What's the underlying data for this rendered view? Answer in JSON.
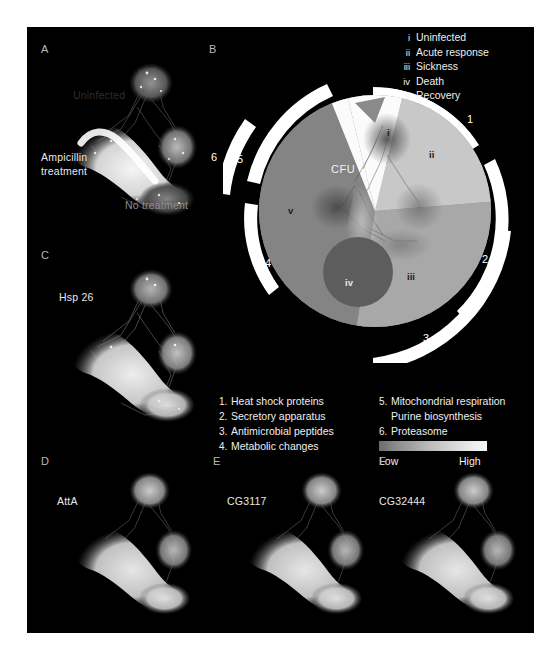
{
  "figure": {
    "background": "#000000",
    "page_background": "#ffffff"
  },
  "panels": [
    {
      "letter": "A",
      "title": "Ampicillin\ntreatment",
      "label_ampicillin": "Ampicillin",
      "label_treatment": "treatment",
      "label_uninfected": "Uninfected",
      "label_no_treatment": "No treatment"
    },
    {
      "letter": "B",
      "title": ""
    },
    {
      "letter": "C",
      "title": "Hsp 26"
    },
    {
      "letter": "D",
      "title": "AttA"
    },
    {
      "letter": "E",
      "title": "CG3117"
    },
    {
      "letter": "F",
      "title": "CG32444"
    }
  ],
  "panel_letters": {
    "a": "A",
    "b": "B",
    "c": "C",
    "d": "D",
    "e": "E",
    "f": "F"
  },
  "stage_legend": {
    "items": [
      {
        "roman": "i",
        "label": "Uninfected"
      },
      {
        "roman": "ii",
        "label": "Acute response"
      },
      {
        "roman": "iii",
        "label": "Sickness"
      },
      {
        "roman": "iv",
        "label": "Death"
      },
      {
        "roman": "v",
        "label": "Recovery"
      }
    ]
  },
  "module_legend": {
    "column_a": [
      {
        "num": "1.",
        "label": "Heat shock proteins"
      },
      {
        "num": "2.",
        "label": "Secretory apparatus"
      },
      {
        "num": "3.",
        "label": "Antimicrobial peptides"
      },
      {
        "num": "4.",
        "label": "Metabolic changes"
      }
    ],
    "column_b": [
      {
        "num": "5.",
        "label": "Mitochondrial respiration"
      },
      {
        "num": "",
        "label": "Purine biosynthesis"
      },
      {
        "num": "6.",
        "label": "Proteasome"
      }
    ]
  },
  "colorbar": {
    "low_label": "Low",
    "high_label": "High",
    "low_color": "#6d6d6d",
    "high_color": "#f6f6f6"
  },
  "diagram": {
    "cfu_label": "CFU",
    "sector_labels": {
      "i": "i",
      "ii": "ii",
      "iii": "iii",
      "iv": "iv",
      "v": "v"
    },
    "arc_numbers": {
      "one": "1",
      "two": "2",
      "three": "3",
      "four": "4",
      "five": "5",
      "six": "6"
    }
  }
}
